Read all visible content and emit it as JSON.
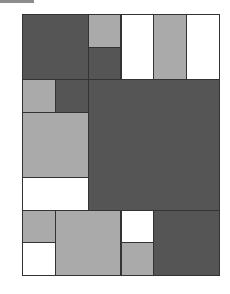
{
  "board": {
    "cols": 6,
    "rows": 8,
    "colors": {
      "dark": "#555555",
      "light": "#aaaaaa",
      "white": "#ffffff"
    },
    "blocks": [
      {
        "col": 0,
        "row": 0,
        "w": 2,
        "h": 2,
        "color": "dark"
      },
      {
        "col": 2,
        "row": 0,
        "w": 1,
        "h": 1,
        "color": "light"
      },
      {
        "col": 2,
        "row": 1,
        "w": 1,
        "h": 1,
        "color": "dark"
      },
      {
        "col": 3,
        "row": 0,
        "w": 1,
        "h": 2,
        "color": "white"
      },
      {
        "col": 4,
        "row": 0,
        "w": 1,
        "h": 2,
        "color": "light"
      },
      {
        "col": 5,
        "row": 0,
        "w": 1,
        "h": 2,
        "color": "white"
      },
      {
        "col": 0,
        "row": 2,
        "w": 1,
        "h": 1,
        "color": "light"
      },
      {
        "col": 1,
        "row": 2,
        "w": 1,
        "h": 1,
        "color": "dark"
      },
      {
        "col": 2,
        "row": 2,
        "w": 4,
        "h": 4,
        "color": "dark"
      },
      {
        "col": 0,
        "row": 3,
        "w": 2,
        "h": 2,
        "color": "light"
      },
      {
        "col": 0,
        "row": 5,
        "w": 2,
        "h": 1,
        "color": "white"
      },
      {
        "col": 0,
        "row": 6,
        "w": 1,
        "h": 1,
        "color": "light"
      },
      {
        "col": 0,
        "row": 7,
        "w": 1,
        "h": 1,
        "color": "white"
      },
      {
        "col": 1,
        "row": 6,
        "w": 2,
        "h": 2,
        "color": "light"
      },
      {
        "col": 3,
        "row": 6,
        "w": 1,
        "h": 1,
        "color": "white"
      },
      {
        "col": 3,
        "row": 7,
        "w": 1,
        "h": 1,
        "color": "light"
      },
      {
        "col": 4,
        "row": 6,
        "w": 2,
        "h": 2,
        "color": "dark"
      }
    ]
  }
}
